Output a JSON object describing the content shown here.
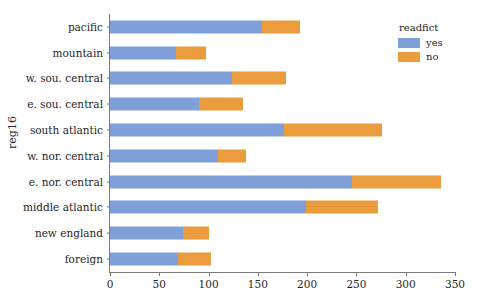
{
  "chart_data": {
    "type": "bar",
    "orientation": "horizontal",
    "stacked": true,
    "title": "",
    "xlabel": "",
    "ylabel": "reg16",
    "xlim": [
      0,
      350
    ],
    "xticks": [
      0,
      50,
      100,
      150,
      200,
      250,
      300,
      350
    ],
    "grid": false,
    "legend": {
      "title": "readfict",
      "position": "upper right",
      "entries": [
        {
          "name": "yes",
          "color": "#7f9fd9"
        },
        {
          "name": "no",
          "color": "#eb9c3c"
        }
      ]
    },
    "categories": [
      "pacific",
      "mountain",
      "w. sou. central",
      "e. sou. central",
      "south atlantic",
      "w. nor. central",
      "e. nor. central",
      "middle atlantic",
      "new england",
      "foreign"
    ],
    "series": [
      {
        "name": "yes",
        "color": "#7f9fd9",
        "values": [
          154,
          67,
          124,
          90,
          177,
          110,
          246,
          199,
          74,
          69
        ]
      },
      {
        "name": "no",
        "color": "#eb9c3c",
        "values": [
          39,
          30,
          55,
          45,
          99,
          28,
          90,
          73,
          26,
          33
        ]
      }
    ],
    "totals": [
      193,
      97,
      179,
      135,
      276,
      138,
      336,
      272,
      100,
      102
    ]
  },
  "colors": {
    "yes": "#7f9fd9",
    "no": "#eb9c3c",
    "axis": "#7a7a7a",
    "text": "#262626",
    "background": "#ffffff"
  }
}
